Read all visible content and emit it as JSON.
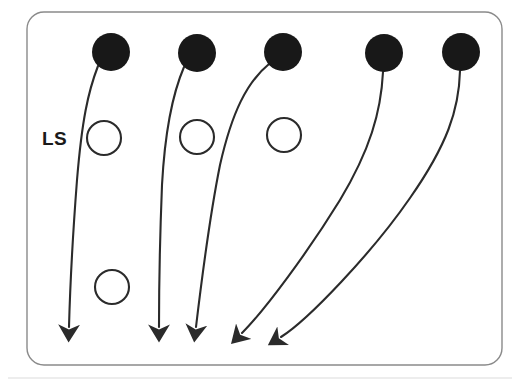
{
  "figure": {
    "title": "",
    "caption": "",
    "label_ls": "LS",
    "background_color": "#ffffff",
    "stroke_color": "#2b2b2b",
    "border_color": "#8a8a8a",
    "filled_node_color": "#181818",
    "open_node_fill": "#ffffff",
    "artifact_line_color": "#d8d8d8"
  },
  "panel": {
    "name": "rounded-rectangle-border",
    "x": 27,
    "y": 12,
    "width": 475,
    "height": 353,
    "corner_radius": 17,
    "stroke_width": 1.4
  },
  "filled_nodes": [
    {
      "id": "filled-1",
      "cx": 111,
      "cy": 52,
      "r": 19
    },
    {
      "id": "filled-2",
      "cx": 197,
      "cy": 53,
      "r": 19
    },
    {
      "id": "filled-3",
      "cx": 283,
      "cy": 52,
      "r": 19
    },
    {
      "id": "filled-4",
      "cx": 384,
      "cy": 53,
      "r": 19
    },
    {
      "id": "filled-5",
      "cx": 461,
      "cy": 52,
      "r": 19
    }
  ],
  "open_nodes": [
    {
      "id": "open-1",
      "cx": 104,
      "cy": 138,
      "r": 17
    },
    {
      "id": "open-2",
      "cx": 197,
      "cy": 137,
      "r": 17
    },
    {
      "id": "open-3",
      "cx": 284,
      "cy": 135,
      "r": 17
    },
    {
      "id": "open-4",
      "cx": 112,
      "cy": 287,
      "r": 17
    }
  ],
  "arrows": [
    {
      "id": "arrow-1",
      "from_node": "filled-1",
      "start": {
        "x": 98,
        "y": 66
      },
      "tip": {
        "x": 69,
        "y": 341
      },
      "path": "M 98 66 C 88 92, 82 120, 77 180 C 73 232, 70 290, 69 327"
    },
    {
      "id": "arrow-2",
      "from_node": "filled-2",
      "start": {
        "x": 184,
        "y": 67
      },
      "tip": {
        "x": 159,
        "y": 341
      },
      "path": "M 184 67 C 172 95, 165 130, 162 185 C 160 235, 159 292, 159 327"
    },
    {
      "id": "arrow-3",
      "from_node": "filled-3",
      "start": {
        "x": 269,
        "y": 64
      },
      "tip": {
        "x": 196,
        "y": 341
      },
      "path": "M 269 64 C 247 82, 232 112, 220 165 C 210 215, 201 285, 196 327"
    },
    {
      "id": "arrow-4",
      "from_node": "filled-4",
      "start": {
        "x": 383,
        "y": 72
      },
      "tip": {
        "x": 235,
        "y": 341
      },
      "path": "M 383 72 C 381 112, 370 150, 340 200 C 308 252, 265 310, 242 333"
    },
    {
      "id": "arrow-5",
      "from_node": "filled-5",
      "start": {
        "x": 460,
        "y": 71
      },
      "tip": {
        "x": 274,
        "y": 344
      },
      "path": "M 460 71 C 459 110, 447 145, 410 198 C 372 253, 308 320, 281 337"
    }
  ],
  "ls_label": {
    "text": "LS",
    "x": 42,
    "y": 145
  },
  "scan_artifact": {
    "y": 378,
    "x1": 8,
    "x2": 512
  }
}
